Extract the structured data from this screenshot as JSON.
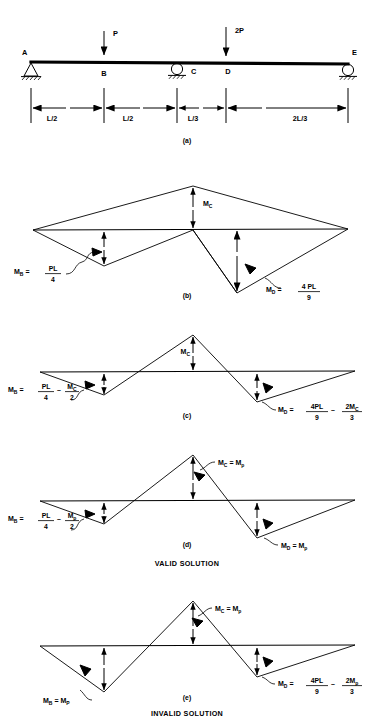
{
  "figure": {
    "type": "structural-bending-moment-diagram",
    "background_color": "#ffffff",
    "line_color": "#000000"
  },
  "beam": {
    "caption": "(a)",
    "nodes": [
      {
        "id": "A",
        "label": "A",
        "x_px": 31,
        "support": "pin"
      },
      {
        "id": "B",
        "label": "B",
        "x_px": 104,
        "support": "none"
      },
      {
        "id": "C",
        "label": "C",
        "x_px": 177,
        "support": "roller"
      },
      {
        "id": "D",
        "label": "D",
        "x_px": 226,
        "support": "none"
      },
      {
        "id": "E",
        "label": "E",
        "x_px": 348,
        "support": "roller"
      }
    ],
    "loads": [
      {
        "label": "P",
        "at_node": "B",
        "direction": "down"
      },
      {
        "label": "2P",
        "at_node": "D",
        "direction": "down"
      }
    ],
    "dimensions": [
      {
        "label": "L/2",
        "from": "A",
        "to": "B"
      },
      {
        "label": "L/2",
        "from": "B",
        "to": "C"
      },
      {
        "label": "L/3",
        "from": "C",
        "to": "D"
      },
      {
        "label": "2L/3",
        "from": "D",
        "to": "E"
      }
    ]
  },
  "diagrams": [
    {
      "id": "b",
      "caption": "(b)",
      "peak_label": {
        "base": "M",
        "sub": "C"
      },
      "annotations": [
        {
          "name": "moment-at-B",
          "lhs_base": "M",
          "lhs_sub": "B",
          "eq": "=",
          "num": "PL",
          "den": "4",
          "text": "M_B = PL/4"
        },
        {
          "name": "moment-at-D",
          "lhs_base": "M",
          "lhs_sub": "D",
          "eq": "=",
          "num": "4 PL",
          "den": "9",
          "text": "M_D = 4PL/9"
        }
      ]
    },
    {
      "id": "c",
      "caption": "(c)",
      "peak_label": {
        "base": "M",
        "sub": "C"
      },
      "annotations": [
        {
          "name": "moment-at-B",
          "lhs_base": "M",
          "lhs_sub": "B",
          "eq": "=",
          "num1": "PL",
          "den1": "4",
          "op": "–",
          "num2": "M",
          "num2_sub": "C",
          "den2": "2",
          "text": "M_B = PL/4 – M_C/2"
        },
        {
          "name": "moment-at-D",
          "lhs_base": "M",
          "lhs_sub": "D",
          "eq": "=",
          "num1": "4PL",
          "den1": "9",
          "op": "–",
          "num2": "2M",
          "num2_sub": "C",
          "den2": "3",
          "text": "M_D = 4PL/9 – 2M_C/3"
        }
      ]
    },
    {
      "id": "d",
      "caption": "(d)",
      "status": "VALID SOLUTION",
      "peak_annotation": {
        "name": "moment-at-C",
        "lhs_base": "M",
        "lhs_sub": "C",
        "eq": "=",
        "rhs_base": "M",
        "rhs_sub": "p",
        "text": "M_C = M_p"
      },
      "annotations": [
        {
          "name": "moment-at-B",
          "lhs_base": "M",
          "lhs_sub": "B",
          "eq": "=",
          "num1": "PL",
          "den1": "4",
          "op": "–",
          "num2": "M",
          "num2_sub": "p",
          "den2": "2",
          "text": "M_B = PL/4 – M_p/2"
        },
        {
          "name": "moment-at-D",
          "lhs_base": "M",
          "lhs_sub": "D",
          "eq": "=",
          "rhs_base": "M",
          "rhs_sub": "p",
          "text": "M_D = M_p"
        }
      ]
    },
    {
      "id": "e",
      "caption": "(e)",
      "status": "INVALID SOLUTION",
      "peak_annotation": {
        "name": "moment-at-C",
        "lhs_base": "M",
        "lhs_sub": "C",
        "eq": "=",
        "rhs_base": "M",
        "rhs_sub": "p",
        "text": "M_C = M_p"
      },
      "annotations": [
        {
          "name": "moment-at-B",
          "lhs_base": "M",
          "lhs_sub": "B",
          "eq": "=",
          "rhs_base": "M",
          "rhs_sub": "P",
          "text": "M_B = M_P"
        },
        {
          "name": "moment-at-D",
          "lhs_base": "M",
          "lhs_sub": "D",
          "eq": "=",
          "num1": "4PL",
          "den1": "9",
          "op": "–",
          "num2": "2M",
          "num2_sub": "p",
          "den2": "3",
          "text": "M_D = 4PL/9 – 2M_p/3"
        }
      ]
    }
  ],
  "status_labels": {
    "valid": "VALID SOLUTION",
    "invalid": "INVALID SOLUTION"
  }
}
